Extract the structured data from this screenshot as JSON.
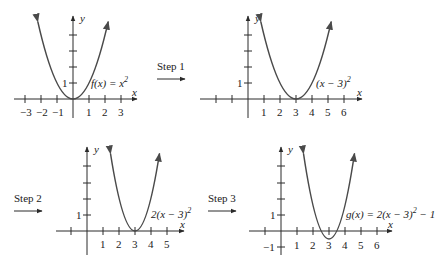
{
  "figure": {
    "steps": [
      {
        "label": "Step 1"
      },
      {
        "label": "Step 2"
      },
      {
        "label": "Step 3"
      }
    ],
    "axis_labels": {
      "x": "x",
      "y": "y"
    },
    "graphs": [
      {
        "name": "f(x) = x^2",
        "label": "f(x) = x",
        "label_sup": "2",
        "x_ticks": [
          "−3",
          "−2",
          "−1",
          "1",
          "2",
          "3"
        ],
        "y_tick_label": "1"
      },
      {
        "name": "(x − 3)^2",
        "label": "(x − 3)",
        "label_sup": "2",
        "x_ticks": [
          "1",
          "2",
          "3",
          "4",
          "5",
          "6"
        ],
        "y_tick_label": "1"
      },
      {
        "name": "2(x − 3)^2",
        "label": "2(x − 3)",
        "label_sup": "2",
        "x_ticks": [
          "1",
          "2",
          "3",
          "4",
          "5"
        ],
        "y_tick_label": "1"
      },
      {
        "name": "g(x) = 2(x − 3)^2 − 1",
        "label_pre": "g(x) = 2(x − 3)",
        "label_sup": "2",
        "label_post": " − 1",
        "x_ticks": [
          "1",
          "2",
          "3",
          "4",
          "5",
          "6"
        ],
        "y_tick_label": "1",
        "y_tick_neg_label": "−1"
      }
    ]
  }
}
